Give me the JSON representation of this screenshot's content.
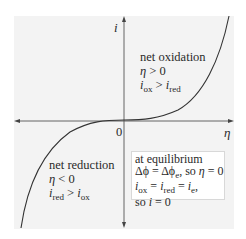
{
  "figure": {
    "axes": {
      "y_label": "i",
      "x_label": "η",
      "origin_label": "0"
    },
    "regions": {
      "oxidation": {
        "title": "net oxidation",
        "condition_lhs": "η",
        "condition_op": " > 0",
        "relation": {
          "a": "i",
          "a_sub": "ox",
          "op": " > ",
          "b": "i",
          "b_sub": "red"
        }
      },
      "reduction": {
        "title": "net reduction",
        "condition_lhs": "η",
        "condition_op": " < 0",
        "relation": {
          "a": "i",
          "a_sub": "red",
          "op": " > ",
          "b": "i",
          "b_sub": "ox"
        }
      }
    },
    "equilibrium": {
      "title": "at equilibrium",
      "line2": {
        "a": "Δϕ = Δϕ",
        "a_sub": "e",
        "mid": ", so ",
        "eta": "η",
        "tail": " = 0"
      },
      "line3": {
        "a": "i",
        "a_sub": "ox",
        "eq1": " = ",
        "b": "i",
        "b_sub": "red",
        "eq2": " = ",
        "c": "i",
        "c_sub": "e",
        "tail": ","
      },
      "line4": {
        "pre": "so ",
        "i": "i",
        "tail": " = 0"
      }
    },
    "colors": {
      "panel_bg": "#f3f3f3",
      "axis": "#555555",
      "curve": "#333333",
      "box_bg": "#ffffff"
    }
  }
}
